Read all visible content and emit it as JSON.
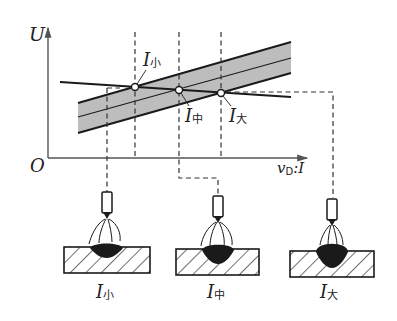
{
  "axes": {
    "y_label": "U",
    "origin_label": "O",
    "x_label_main": "v",
    "x_label_sub": "D",
    "x_label_tail": ":I"
  },
  "points": [
    {
      "id": "small",
      "label_main": "I",
      "label_sub": "小"
    },
    {
      "id": "medium",
      "label_main": "I",
      "label_sub": "中"
    },
    {
      "id": "large",
      "label_main": "I",
      "label_sub": "大"
    }
  ],
  "welds": [
    {
      "label_main": "I",
      "label_sub": "小"
    },
    {
      "label_main": "I",
      "label_sub": "中"
    },
    {
      "label_main": "I",
      "label_sub": "大"
    }
  ],
  "colors": {
    "band_fill": "#bdbdbd",
    "line": "#1a1a1a",
    "dash": "#333333"
  }
}
